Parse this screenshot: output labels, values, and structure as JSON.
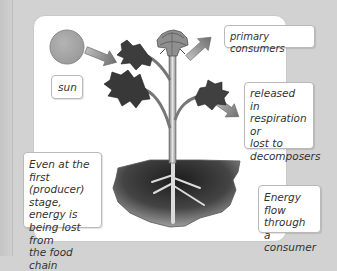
{
  "diagram": {
    "labels": {
      "sun": "sun",
      "primary_consumers": "primary consumers",
      "released": [
        "released in",
        "respiration or",
        "lost to",
        "decomposers"
      ],
      "even_at_first": [
        "Even at the first",
        "(producer)",
        "stage, energy is",
        "being lost from",
        "the food chain"
      ],
      "energy_flow": [
        "Energy flow",
        "through a",
        "consumer"
      ]
    },
    "elements": {
      "sun": "sun-circle",
      "plant": "flowering-plant",
      "soil": "soil-patch",
      "arrows": [
        {
          "from": "sun",
          "to": "plant"
        },
        {
          "from": "plant",
          "to": "primary consumers"
        },
        {
          "from": "plant",
          "to": "respiration / decomposers"
        }
      ]
    },
    "colors": {
      "background": "#d2d2d2",
      "panel": "#ffffff",
      "sun": "#a9a9a9",
      "leaf": "#3a3a3a",
      "soil_dark": "#222222",
      "soil_light": "#9a9a9a",
      "arrow": "#8a8a8a"
    }
  }
}
